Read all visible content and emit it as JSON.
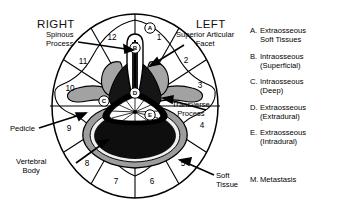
{
  "figure": {
    "title_right": "RIGHT",
    "title_left": "LEFT",
    "type": "vertebral-cross-section-clockface",
    "clock_sectors": [
      "1",
      "2",
      "3",
      "4",
      "5",
      "6",
      "7",
      "8",
      "9",
      "10",
      "11",
      "12"
    ],
    "zone_markers": [
      "A",
      "B",
      "C",
      "D",
      "E"
    ]
  },
  "annotations": {
    "spinous_process": "Spinous\nProcess",
    "spinous_process_l1": "Spinous",
    "spinous_process_l2": "Process",
    "superior_articular_l1": "Superior Articular",
    "superior_articular_l2": "Facet",
    "transverse_l1": "Transverse",
    "transverse_l2": "Process",
    "pedicle": "Pedicle",
    "vertebral_body_l1": "Vertebral",
    "vertebral_body_l2": "Body",
    "soft_tissue_l1": "Soft",
    "soft_tissue_l2": "Tissue"
  },
  "legend": {
    "items": [
      {
        "key": "A.",
        "line1": "Extraosseous",
        "line2": "Soft Tissues"
      },
      {
        "key": "B.",
        "line1": "Intraosseous",
        "line2": "(Superficial)"
      },
      {
        "key": "C.",
        "line1": "Intraosseous",
        "line2": "(Deep)"
      },
      {
        "key": "D.",
        "line1": "Extraosseous",
        "line2": "(Extradural)"
      },
      {
        "key": "E.",
        "line1": "Extraosseous",
        "line2": "(Intradural)"
      }
    ],
    "metastasis": {
      "key": "M.",
      "line1": "Metastasis"
    }
  },
  "colors": {
    "ink": "#000000",
    "background": "#ffffff",
    "cortical_bone": "#9a9a9a",
    "cancellous_dark": "#111111",
    "cord_fill": "#ffffff"
  }
}
